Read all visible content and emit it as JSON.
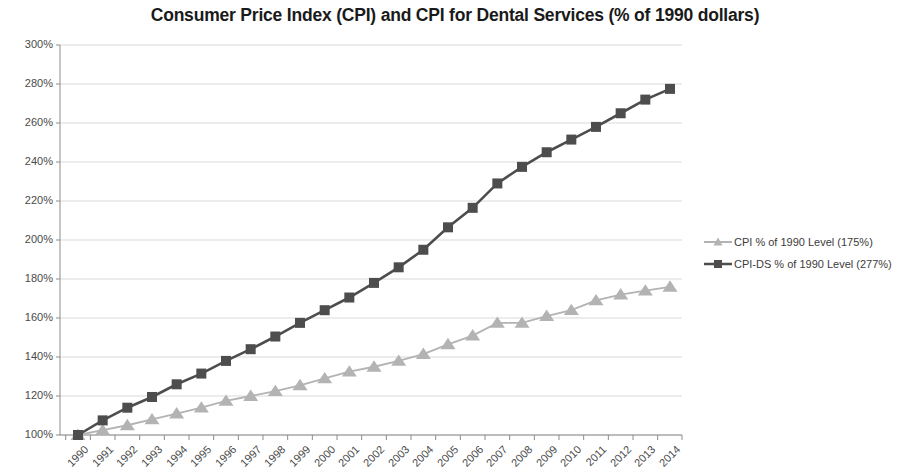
{
  "chart_data": {
    "type": "line",
    "title": "Consumer Price Index (CPI) and CPI for Dental Services (% of 1990 dollars)",
    "xlabel": "",
    "ylabel": "",
    "ylim": [
      100,
      300
    ],
    "ytick_step": 20,
    "ytick_labels": [
      "100%",
      "120%",
      "140%",
      "160%",
      "180%",
      "200%",
      "220%",
      "240%",
      "260%",
      "280%",
      "300%"
    ],
    "ytick_values": [
      100,
      120,
      140,
      160,
      180,
      200,
      220,
      240,
      260,
      280,
      300
    ],
    "grid": true,
    "grid_axis": "y",
    "legend_position": "right",
    "categories": [
      "1990",
      "1991",
      "1992",
      "1993",
      "1994",
      "1995",
      "1996",
      "1997",
      "1998",
      "1999",
      "2000",
      "2001",
      "2002",
      "2003",
      "2004",
      "2005",
      "2006",
      "2007",
      "2008",
      "2009",
      "2010",
      "2011",
      "2012",
      "2013",
      "2014"
    ],
    "series": [
      {
        "name": "CPI % of 1990 Level (175%)",
        "color": "#b3b3b3",
        "marker": "triangle",
        "values": [
          100,
          102.5,
          105,
          108,
          111,
          114,
          117.5,
          120,
          122.5,
          125.5,
          129,
          132.5,
          135,
          138,
          141.5,
          146.5,
          151,
          157.5,
          157.5,
          161,
          164,
          169,
          172,
          174,
          176
        ]
      },
      {
        "name": "CPI-DS % of 1990 Level (277%)",
        "color": "#4d4d4d",
        "marker": "square",
        "values": [
          100,
          107.5,
          114,
          119.5,
          126,
          131.5,
          138,
          144,
          150.5,
          157.5,
          164,
          170.5,
          178,
          186,
          195,
          206.5,
          216.5,
          229,
          237.5,
          245,
          251.5,
          258,
          265,
          272,
          277.5
        ]
      }
    ]
  },
  "legend": {
    "items": [
      {
        "label": "CPI % of 1990 Level (175%)"
      },
      {
        "label": "CPI-DS % of 1990 Level (277%)"
      }
    ]
  }
}
